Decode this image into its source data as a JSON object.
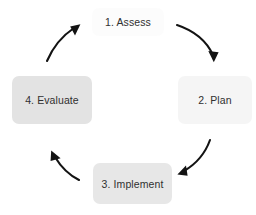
{
  "diagram": {
    "type": "cycle",
    "direction": "clockwise",
    "background_color": "#ffffff",
    "text_color": "#303030",
    "arrow_color": "#131313",
    "nodes": [
      {
        "id": "assess",
        "label": "1. Assess",
        "position": "top",
        "fill_color": "#e4e4e4"
      },
      {
        "id": "plan",
        "label": "2. Plan",
        "position": "right",
        "fill_color": "#e4e4e4"
      },
      {
        "id": "implement",
        "label": "3. Implement",
        "position": "bottom",
        "fill_color": "#e1e1e1"
      },
      {
        "id": "evaluate",
        "label": "4. Evaluate",
        "position": "left",
        "fill_color": "#e3e3e3"
      }
    ],
    "connectors": [
      {
        "id": "assess-to-plan",
        "from": "assess",
        "to": "plan",
        "icon": "curved-arrow-icon"
      },
      {
        "id": "plan-to-implement",
        "from": "plan",
        "to": "implement",
        "icon": "curved-arrow-icon"
      },
      {
        "id": "implement-to-evaluate",
        "from": "implement",
        "to": "evaluate",
        "icon": "curved-arrow-icon"
      },
      {
        "id": "evaluate-to-assess",
        "from": "evaluate",
        "to": "assess",
        "icon": "curved-arrow-icon"
      }
    ]
  }
}
